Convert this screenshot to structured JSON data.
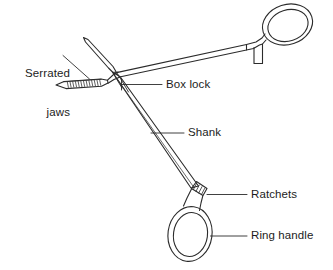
{
  "figure": {
    "background_color": "#ffffff",
    "line_color": "#2b2b2b",
    "text_color": "#1c1c1c",
    "width": 333,
    "height": 270
  },
  "labels": [
    {
      "id": "serrated-jaws",
      "line1": "Serrated",
      "line2": "jaws",
      "align": "right",
      "x": 8,
      "y": 41
    },
    {
      "id": "box-lock",
      "text": "Box lock",
      "align": "left",
      "x": 166,
      "y": 80
    },
    {
      "id": "shank",
      "text": "Shank",
      "align": "left",
      "x": 188,
      "y": 128
    },
    {
      "id": "ratchets",
      "text": "Ratchets",
      "align": "left",
      "x": 251,
      "y": 190
    },
    {
      "id": "ring-handle",
      "text": "Ring handle",
      "align": "left",
      "x": 251,
      "y": 231
    }
  ],
  "parts": [
    {
      "id": "serrated-jaws",
      "name": "Serrated jaws"
    },
    {
      "id": "box-lock",
      "name": "Box lock"
    },
    {
      "id": "shank",
      "name": "Shank"
    },
    {
      "id": "ratchets",
      "name": "Ratchets"
    },
    {
      "id": "ring-handle",
      "name": "Ring handle"
    }
  ]
}
